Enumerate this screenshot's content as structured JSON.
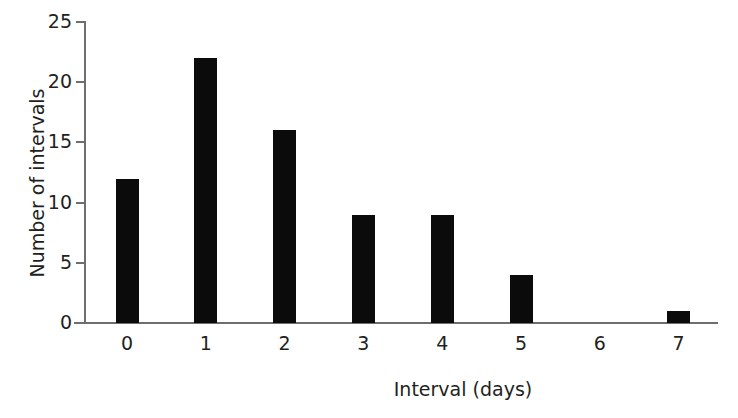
{
  "chart_data": {
    "type": "bar",
    "title": "",
    "xlabel": "Interval (days)",
    "ylabel": "Number of intervals",
    "categories": [
      "0",
      "1",
      "2",
      "3",
      "4",
      "5",
      "6",
      "7"
    ],
    "values": [
      12,
      22,
      16,
      9,
      9,
      4,
      0,
      1
    ],
    "series": [
      {
        "name": "Number of intervals",
        "values": [
          12,
          22,
          16,
          9,
          9,
          4,
          0,
          1
        ]
      }
    ],
    "ylim": [
      0,
      25
    ],
    "yticks": [
      0,
      5,
      10,
      15,
      20,
      25
    ],
    "ytick_labels": [
      "0",
      "5",
      "10",
      "15",
      "20",
      "25"
    ],
    "xtick_labels": [
      "0",
      "1",
      "2",
      "3",
      "4",
      "5",
      "6",
      "7"
    ],
    "grid": false,
    "legend": null,
    "legend_position": "none",
    "bar_color": "#0b0b0b",
    "axis_color": "#6e6e6e",
    "text_color": "#231f20",
    "background": "#ffffff"
  },
  "axes": {
    "x_title": "Interval (days)",
    "y_title": "Number of intervals"
  }
}
